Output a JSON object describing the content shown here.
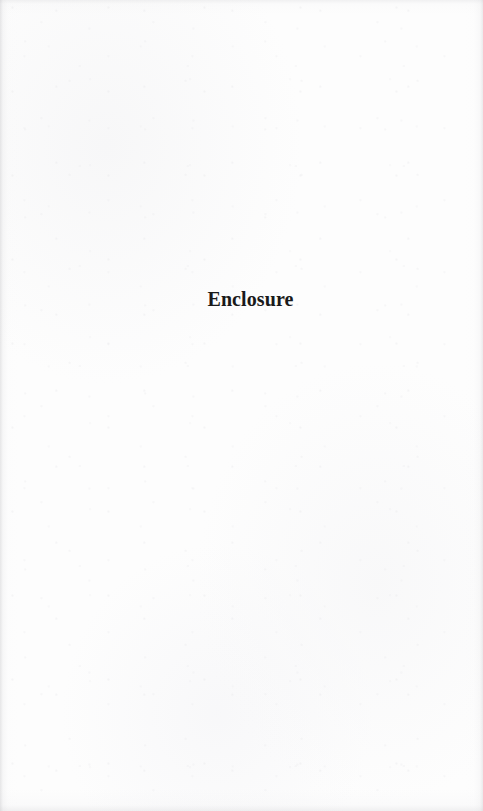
{
  "document": {
    "page_label": "Enclosure",
    "body_text": "Enclosure",
    "text_color": "#1a1a1a",
    "background_color": "#fdfdfd",
    "page_width": 483,
    "page_height": 811
  }
}
